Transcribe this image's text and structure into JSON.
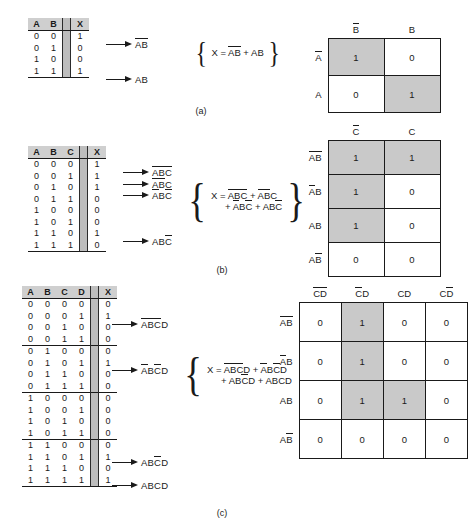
{
  "figure": {
    "captions": {
      "a": "(a)",
      "b": "(b)",
      "c": "(c)"
    }
  },
  "panel_a": {
    "truth_table": {
      "headers": [
        "A",
        "B",
        "X"
      ],
      "rows": [
        {
          "inputs": [
            "0",
            "0"
          ],
          "out": "1"
        },
        {
          "inputs": [
            "0",
            "1"
          ],
          "out": "0"
        },
        {
          "inputs": [
            "1",
            "0"
          ],
          "out": "0"
        },
        {
          "inputs": [
            "1",
            "1"
          ],
          "out": "1"
        }
      ]
    },
    "terms": [
      {
        "row": 0,
        "vars": [
          {
            "t": "A",
            "bar": true
          },
          {
            "t": "B",
            "bar": true
          }
        ]
      },
      {
        "row": 3,
        "vars": [
          {
            "t": "A",
            "bar": false
          },
          {
            "t": "B",
            "bar": false
          }
        ]
      }
    ],
    "equation": {
      "lhs": "X =",
      "line1": "AB + AB",
      "line2": ""
    },
    "kmap": {
      "col_headers": [
        {
          "t": "B",
          "bar": true
        },
        {
          "t": "B",
          "bar": false
        }
      ],
      "row_headers": [
        {
          "t": "A",
          "bar": true
        },
        {
          "t": "A",
          "bar": false
        }
      ],
      "cells": [
        [
          {
            "v": "1",
            "shade": true
          },
          {
            "v": "0",
            "shade": false
          }
        ],
        [
          {
            "v": "0",
            "shade": false
          },
          {
            "v": "1",
            "shade": true
          }
        ]
      ]
    }
  },
  "panel_b": {
    "truth_table": {
      "headers": [
        "A",
        "B",
        "C",
        "X"
      ],
      "rows": [
        {
          "inputs": [
            "0",
            "0",
            "0"
          ],
          "out": "1"
        },
        {
          "inputs": [
            "0",
            "0",
            "1"
          ],
          "out": "1"
        },
        {
          "inputs": [
            "0",
            "1",
            "0"
          ],
          "out": "1"
        },
        {
          "inputs": [
            "0",
            "1",
            "1"
          ],
          "out": "0"
        },
        {
          "inputs": [
            "1",
            "0",
            "0"
          ],
          "out": "0"
        },
        {
          "inputs": [
            "1",
            "0",
            "1"
          ],
          "out": "0"
        },
        {
          "inputs": [
            "1",
            "1",
            "0"
          ],
          "out": "1"
        },
        {
          "inputs": [
            "1",
            "1",
            "1"
          ],
          "out": "0"
        }
      ]
    },
    "terms": [
      {
        "row": 0,
        "vars": [
          {
            "t": "A",
            "bar": true
          },
          {
            "t": "B",
            "bar": true
          },
          {
            "t": "C",
            "bar": true
          }
        ]
      },
      {
        "row": 1,
        "vars": [
          {
            "t": "A",
            "bar": true
          },
          {
            "t": "B",
            "bar": true
          },
          {
            "t": "C",
            "bar": false
          }
        ]
      },
      {
        "row": 2,
        "vars": [
          {
            "t": "A",
            "bar": true
          },
          {
            "t": "B",
            "bar": false
          },
          {
            "t": "C",
            "bar": true
          }
        ]
      },
      {
        "row": 6,
        "vars": [
          {
            "t": "A",
            "bar": false
          },
          {
            "t": "B",
            "bar": false
          },
          {
            "t": "C",
            "bar": true
          }
        ]
      }
    ],
    "equation": {
      "lhs": "X =",
      "line1": "ABC + ABC",
      "line2": "+ ABC + ABC"
    },
    "kmap": {
      "col_headers": [
        {
          "t": "C",
          "bar": true
        },
        {
          "t": "C",
          "bar": false
        }
      ],
      "row_headers": [
        {
          "p": [
            {
              "t": "A",
              "bar": true
            },
            {
              "t": "B",
              "bar": true
            }
          ]
        },
        {
          "p": [
            {
              "t": "A",
              "bar": true
            },
            {
              "t": "B",
              "bar": false
            }
          ]
        },
        {
          "p": [
            {
              "t": "A",
              "bar": false
            },
            {
              "t": "B",
              "bar": false
            }
          ]
        },
        {
          "p": [
            {
              "t": "A",
              "bar": false
            },
            {
              "t": "B",
              "bar": true
            }
          ]
        }
      ],
      "cells": [
        [
          {
            "v": "1",
            "shade": true
          },
          {
            "v": "1",
            "shade": true
          }
        ],
        [
          {
            "v": "1",
            "shade": true
          },
          {
            "v": "0",
            "shade": false
          }
        ],
        [
          {
            "v": "1",
            "shade": true
          },
          {
            "v": "0",
            "shade": false
          }
        ],
        [
          {
            "v": "0",
            "shade": false
          },
          {
            "v": "0",
            "shade": false
          }
        ]
      ]
    }
  },
  "panel_c": {
    "truth_table": {
      "headers": [
        "A",
        "B",
        "C",
        "D",
        "X"
      ],
      "rows": [
        {
          "inputs": [
            "0",
            "0",
            "0",
            "0"
          ],
          "out": "0"
        },
        {
          "inputs": [
            "0",
            "0",
            "0",
            "1"
          ],
          "out": "1"
        },
        {
          "inputs": [
            "0",
            "0",
            "1",
            "0"
          ],
          "out": "0"
        },
        {
          "inputs": [
            "0",
            "0",
            "1",
            "1"
          ],
          "out": "0"
        },
        {
          "inputs": [
            "0",
            "1",
            "0",
            "0"
          ],
          "out": "0"
        },
        {
          "inputs": [
            "0",
            "1",
            "0",
            "1"
          ],
          "out": "1"
        },
        {
          "inputs": [
            "0",
            "1",
            "1",
            "0"
          ],
          "out": "0"
        },
        {
          "inputs": [
            "0",
            "1",
            "1",
            "1"
          ],
          "out": "0"
        },
        {
          "inputs": [
            "1",
            "0",
            "0",
            "0"
          ],
          "out": "0"
        },
        {
          "inputs": [
            "1",
            "0",
            "0",
            "1"
          ],
          "out": "0"
        },
        {
          "inputs": [
            "1",
            "0",
            "1",
            "0"
          ],
          "out": "0"
        },
        {
          "inputs": [
            "1",
            "0",
            "1",
            "1"
          ],
          "out": "0"
        },
        {
          "inputs": [
            "1",
            "1",
            "0",
            "0"
          ],
          "out": "0"
        },
        {
          "inputs": [
            "1",
            "1",
            "0",
            "1"
          ],
          "out": "1"
        },
        {
          "inputs": [
            "1",
            "1",
            "1",
            "0"
          ],
          "out": "0"
        },
        {
          "inputs": [
            "1",
            "1",
            "1",
            "1"
          ],
          "out": "1"
        }
      ]
    },
    "terms": [
      {
        "row": 1,
        "vars": [
          {
            "t": "A",
            "bar": true
          },
          {
            "t": "B",
            "bar": true
          },
          {
            "t": "C",
            "bar": true
          },
          {
            "t": "D",
            "bar": false
          }
        ]
      },
      {
        "row": 5,
        "vars": [
          {
            "t": "A",
            "bar": true
          },
          {
            "t": "B",
            "bar": false
          },
          {
            "t": "C",
            "bar": true
          },
          {
            "t": "D",
            "bar": false
          }
        ]
      },
      {
        "row": 13,
        "vars": [
          {
            "t": "A",
            "bar": false
          },
          {
            "t": "B",
            "bar": false
          },
          {
            "t": "C",
            "bar": true
          },
          {
            "t": "D",
            "bar": false
          }
        ]
      },
      {
        "row": 15,
        "vars": [
          {
            "t": "A",
            "bar": false
          },
          {
            "t": "B",
            "bar": false
          },
          {
            "t": "C",
            "bar": false
          },
          {
            "t": "D",
            "bar": false
          }
        ]
      }
    ],
    "equation": {
      "lhs": "X =",
      "line1": "ABCD + ABCD",
      "line2": "+ ABCD + ABCD"
    },
    "kmap": {
      "col_headers": [
        {
          "p": [
            {
              "t": "C",
              "bar": true
            },
            {
              "t": "D",
              "bar": true
            }
          ]
        },
        {
          "p": [
            {
              "t": "C",
              "bar": true
            },
            {
              "t": "D",
              "bar": false
            }
          ]
        },
        {
          "p": [
            {
              "t": "C",
              "bar": false
            },
            {
              "t": "D",
              "bar": false
            }
          ]
        },
        {
          "p": [
            {
              "t": "C",
              "bar": false
            },
            {
              "t": "D",
              "bar": true
            }
          ]
        }
      ],
      "row_headers": [
        {
          "p": [
            {
              "t": "A",
              "bar": true
            },
            {
              "t": "B",
              "bar": true
            }
          ]
        },
        {
          "p": [
            {
              "t": "A",
              "bar": true
            },
            {
              "t": "B",
              "bar": false
            }
          ]
        },
        {
          "p": [
            {
              "t": "A",
              "bar": false
            },
            {
              "t": "B",
              "bar": false
            }
          ]
        },
        {
          "p": [
            {
              "t": "A",
              "bar": false
            },
            {
              "t": "B",
              "bar": true
            }
          ]
        }
      ],
      "cells": [
        [
          {
            "v": "0",
            "shade": false
          },
          {
            "v": "1",
            "shade": true
          },
          {
            "v": "0",
            "shade": false
          },
          {
            "v": "0",
            "shade": false
          }
        ],
        [
          {
            "v": "0",
            "shade": false
          },
          {
            "v": "1",
            "shade": true
          },
          {
            "v": "0",
            "shade": false
          },
          {
            "v": "0",
            "shade": false
          }
        ],
        [
          {
            "v": "0",
            "shade": false
          },
          {
            "v": "1",
            "shade": true
          },
          {
            "v": "1",
            "shade": true
          },
          {
            "v": "0",
            "shade": false
          }
        ],
        [
          {
            "v": "0",
            "shade": false
          },
          {
            "v": "0",
            "shade": false
          },
          {
            "v": "0",
            "shade": false
          },
          {
            "v": "0",
            "shade": false
          }
        ]
      ]
    }
  }
}
